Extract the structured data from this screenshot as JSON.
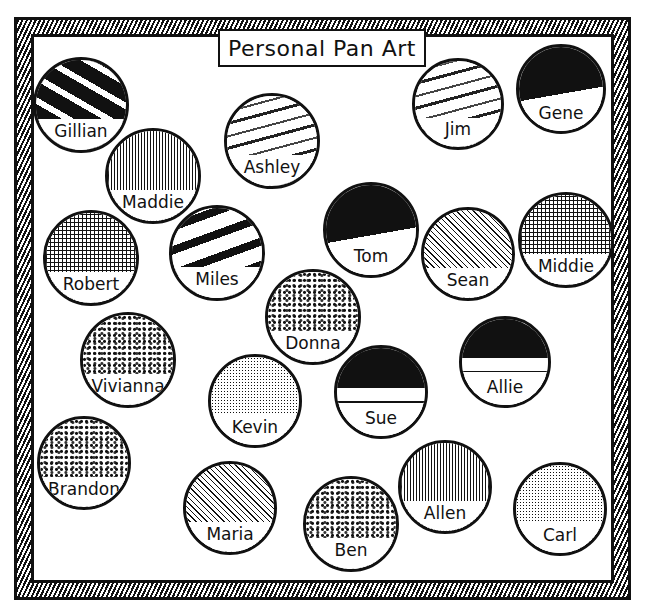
{
  "title": "Personal Pan Art",
  "pans": [
    {
      "name": "Gillian",
      "x": 33,
      "y": 57,
      "d": 96,
      "texture": "t-dark"
    },
    {
      "name": "Maddie",
      "x": 105,
      "y": 128,
      "d": 96,
      "texture": "t-hatch"
    },
    {
      "name": "Ashley",
      "x": 224,
      "y": 93,
      "d": 96,
      "texture": "t-stripe"
    },
    {
      "name": "Jim",
      "x": 412,
      "y": 58,
      "d": 92,
      "texture": "t-stripe"
    },
    {
      "name": "Gene",
      "x": 516,
      "y": 44,
      "d": 90,
      "texture": "t-sky"
    },
    {
      "name": "Robert",
      "x": 43,
      "y": 210,
      "d": 96,
      "texture": "t-grid"
    },
    {
      "name": "Miles",
      "x": 169,
      "y": 205,
      "d": 96,
      "texture": "t-wave"
    },
    {
      "name": "Tom",
      "x": 323,
      "y": 182,
      "d": 96,
      "texture": "t-sky"
    },
    {
      "name": "Sean",
      "x": 421,
      "y": 207,
      "d": 94,
      "texture": "t-diag"
    },
    {
      "name": "Middie",
      "x": 518,
      "y": 192,
      "d": 96,
      "texture": "t-grid"
    },
    {
      "name": "Donna",
      "x": 265,
      "y": 269,
      "d": 96,
      "texture": "t-speckle"
    },
    {
      "name": "Vivianna",
      "x": 80,
      "y": 312,
      "d": 96,
      "texture": "t-speckle"
    },
    {
      "name": "Allie",
      "x": 459,
      "y": 316,
      "d": 92,
      "texture": "t-half"
    },
    {
      "name": "Kevin",
      "x": 208,
      "y": 354,
      "d": 94,
      "texture": "t-dots"
    },
    {
      "name": "Sue",
      "x": 334,
      "y": 345,
      "d": 94,
      "texture": "t-half"
    },
    {
      "name": "Brandon",
      "x": 37,
      "y": 416,
      "d": 94,
      "texture": "t-speckle"
    },
    {
      "name": "Maria",
      "x": 183,
      "y": 461,
      "d": 94,
      "texture": "t-diag"
    },
    {
      "name": "Allen",
      "x": 398,
      "y": 440,
      "d": 94,
      "texture": "t-hatch"
    },
    {
      "name": "Ben",
      "x": 303,
      "y": 476,
      "d": 96,
      "texture": "t-speckle"
    },
    {
      "name": "Carl",
      "x": 513,
      "y": 462,
      "d": 94,
      "texture": "t-dots"
    }
  ]
}
